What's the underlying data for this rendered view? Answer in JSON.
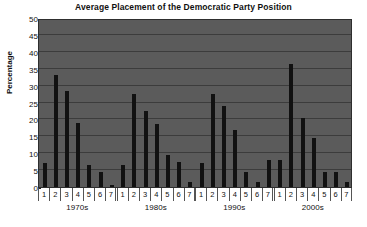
{
  "chart_data": {
    "type": "bar",
    "title": "Average Placement of the Democratic Party Position",
    "xlabel": "",
    "ylabel": "Percentage",
    "ylim": [
      0,
      50
    ],
    "ytick_step": 5,
    "yticks": [
      50,
      45,
      40,
      35,
      30,
      25,
      20,
      15,
      10,
      5,
      0
    ],
    "grid": true,
    "legend": "none",
    "categories": [
      "1",
      "2",
      "3",
      "4",
      "5",
      "6",
      "7"
    ],
    "groups": [
      {
        "label": "1970s",
        "values": [
          7,
          33,
          28.5,
          19,
          6.5,
          4.5,
          0.5
        ]
      },
      {
        "label": "1980s",
        "values": [
          6.5,
          27.5,
          22.5,
          18.5,
          9.5,
          7.5,
          1.5
        ]
      },
      {
        "label": "1990s",
        "values": [
          7,
          27.5,
          24,
          17,
          4.5,
          1.5,
          8
        ]
      },
      {
        "label": "2000s",
        "values": [
          8,
          36.5,
          20.5,
          14.5,
          4.5,
          4.5,
          1.5
        ]
      }
    ],
    "colors": {
      "bar": "#111111",
      "plot_background": "#5b5b5b",
      "gridline": "#3c3c3c",
      "page_background": "#ffffff",
      "text": "#111111"
    }
  }
}
